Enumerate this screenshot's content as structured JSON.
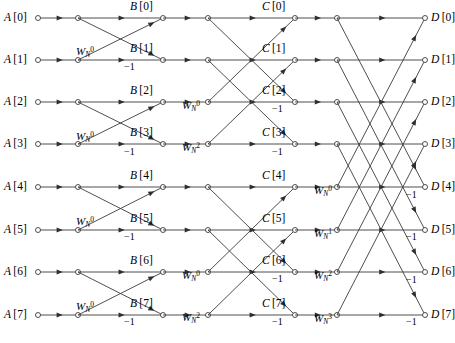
{
  "figure": {
    "name": "radix-2-dit-fft-signal-flow-graph",
    "width": 455,
    "height": 343,
    "stage_count": 3,
    "point_count": 8,
    "minus_one_label": "−1",
    "background_color": "#ffffff",
    "line_color": "#3b3b3b",
    "text_color": "#000000"
  },
  "columns": {
    "input": {
      "key": "A",
      "x": 38
    },
    "stage1_left": {
      "x": 78
    },
    "stage1_right": {
      "key": "B",
      "x": 163
    },
    "stage2_left": {
      "x": 208
    },
    "stage2_right": {
      "key": "C",
      "x": 295
    },
    "stage3_left": {
      "x": 337
    },
    "output": {
      "key": "D",
      "x": 425
    }
  },
  "rows": {
    "y": [
      18,
      60,
      102,
      144,
      187,
      230,
      272,
      315
    ]
  },
  "nodes": {
    "input": [
      {
        "label": "A[0]",
        "base": "A",
        "index": "[0]",
        "row": 0
      },
      {
        "label": "A[1]",
        "base": "A",
        "index": "[1]",
        "row": 1
      },
      {
        "label": "A[2]",
        "base": "A",
        "index": "[2]",
        "row": 2
      },
      {
        "label": "A[3]",
        "base": "A",
        "index": "[3]",
        "row": 3
      },
      {
        "label": "A[4]",
        "base": "A",
        "index": "[4]",
        "row": 4
      },
      {
        "label": "A[5]",
        "base": "A",
        "index": "[5]",
        "row": 5
      },
      {
        "label": "A[6]",
        "base": "A",
        "index": "[6]",
        "row": 6
      },
      {
        "label": "A[7]",
        "base": "A",
        "index": "[7]",
        "row": 7
      }
    ],
    "stage1_out": [
      {
        "label": "B[0]",
        "base": "B",
        "index": "[0]",
        "row": 0
      },
      {
        "label": "B[1]",
        "base": "B",
        "index": "[1]",
        "row": 1
      },
      {
        "label": "B[2]",
        "base": "B",
        "index": "[2]",
        "row": 2
      },
      {
        "label": "B[3]",
        "base": "B",
        "index": "[3]",
        "row": 3
      },
      {
        "label": "B[4]",
        "base": "B",
        "index": "[4]",
        "row": 4
      },
      {
        "label": "B[5]",
        "base": "B",
        "index": "[5]",
        "row": 5
      },
      {
        "label": "B[6]",
        "base": "B",
        "index": "[6]",
        "row": 6
      },
      {
        "label": "B[7]",
        "base": "B",
        "index": "[7]",
        "row": 7
      }
    ],
    "stage2_out": [
      {
        "label": "C[0]",
        "base": "C",
        "index": "[0]",
        "row": 0
      },
      {
        "label": "C[1]",
        "base": "C",
        "index": "[1]",
        "row": 1
      },
      {
        "label": "C[2]",
        "base": "C",
        "index": "[2]",
        "row": 2
      },
      {
        "label": "C[3]",
        "base": "C",
        "index": "[3]",
        "row": 3
      },
      {
        "label": "C[4]",
        "base": "C",
        "index": "[4]",
        "row": 4
      },
      {
        "label": "C[5]",
        "base": "C",
        "index": "[5]",
        "row": 5
      },
      {
        "label": "C[6]",
        "base": "C",
        "index": "[6]",
        "row": 6
      },
      {
        "label": "C[7]",
        "base": "C",
        "index": "[7]",
        "row": 7
      }
    ],
    "output": [
      {
        "label": "D[0]",
        "base": "D",
        "index": "[0]",
        "row": 0
      },
      {
        "label": "D[1]",
        "base": "D",
        "index": "[1]",
        "row": 1
      },
      {
        "label": "D[2]",
        "base": "D",
        "index": "[2]",
        "row": 2
      },
      {
        "label": "D[3]",
        "base": "D",
        "index": "[3]",
        "row": 3
      },
      {
        "label": "D[4]",
        "base": "D",
        "index": "[4]",
        "row": 4
      },
      {
        "label": "D[5]",
        "base": "D",
        "index": "[5]",
        "row": 5
      },
      {
        "label": "D[6]",
        "base": "D",
        "index": "[6]",
        "row": 6
      },
      {
        "label": "D[7]",
        "base": "D",
        "index": "[7]",
        "row": 7
      }
    ]
  },
  "twiddles": {
    "stage1": [
      {
        "row": 1,
        "base": "W",
        "sub": "N",
        "sup": "0",
        "x": 76,
        "y": 46
      },
      {
        "row": 3,
        "base": "W",
        "sub": "N",
        "sup": "0",
        "x": 76,
        "y": 131
      },
      {
        "row": 5,
        "base": "W",
        "sub": "N",
        "sup": "0",
        "x": 76,
        "y": 216
      },
      {
        "row": 7,
        "base": "W",
        "sub": "N",
        "sup": "0",
        "x": 76,
        "y": 301
      }
    ],
    "stage2": [
      {
        "row": 2,
        "base": "W",
        "sub": "N",
        "sup": "0",
        "x": 182,
        "y": 100
      },
      {
        "row": 3,
        "base": "W",
        "sub": "N",
        "sup": "2",
        "x": 182,
        "y": 142
      },
      {
        "row": 6,
        "base": "W",
        "sub": "N",
        "sup": "0",
        "x": 182,
        "y": 270
      },
      {
        "row": 7,
        "base": "W",
        "sub": "N",
        "sup": "2",
        "x": 182,
        "y": 312
      }
    ],
    "stage3": [
      {
        "row": 4,
        "base": "W",
        "sub": "N",
        "sup": "0",
        "x": 314,
        "y": 185
      },
      {
        "row": 5,
        "base": "W",
        "sub": "N",
        "sup": "1",
        "x": 314,
        "y": 228
      },
      {
        "row": 6,
        "base": "W",
        "sub": "N",
        "sup": "2",
        "x": 314,
        "y": 270
      },
      {
        "row": 7,
        "base": "W",
        "sub": "N",
        "sup": "3",
        "x": 314,
        "y": 313
      }
    ]
  },
  "minus_ones": {
    "stage1": [
      {
        "row": 1,
        "x": 124,
        "y": 62
      },
      {
        "row": 3,
        "x": 124,
        "y": 147
      },
      {
        "row": 5,
        "x": 124,
        "y": 232
      },
      {
        "row": 7,
        "x": 124,
        "y": 317
      }
    ],
    "stage2": [
      {
        "row": 2,
        "x": 272,
        "y": 104
      },
      {
        "row": 3,
        "x": 272,
        "y": 147
      },
      {
        "row": 6,
        "x": 272,
        "y": 274
      },
      {
        "row": 7,
        "x": 272,
        "y": 317
      }
    ],
    "stage3": [
      {
        "row": 4,
        "x": 406,
        "y": 190
      },
      {
        "row": 5,
        "x": 406,
        "y": 232
      },
      {
        "row": 6,
        "x": 406,
        "y": 275
      },
      {
        "row": 7,
        "x": 406,
        "y": 317
      }
    ]
  },
  "butterflies": {
    "stage1_pairs": [
      [
        0,
        1
      ],
      [
        2,
        3
      ],
      [
        4,
        5
      ],
      [
        6,
        7
      ]
    ],
    "stage2_pairs": [
      [
        0,
        2
      ],
      [
        1,
        3
      ],
      [
        4,
        6
      ],
      [
        5,
        7
      ]
    ],
    "stage3_pairs": [
      [
        0,
        4
      ],
      [
        1,
        5
      ],
      [
        2,
        6
      ],
      [
        3,
        7
      ]
    ]
  }
}
